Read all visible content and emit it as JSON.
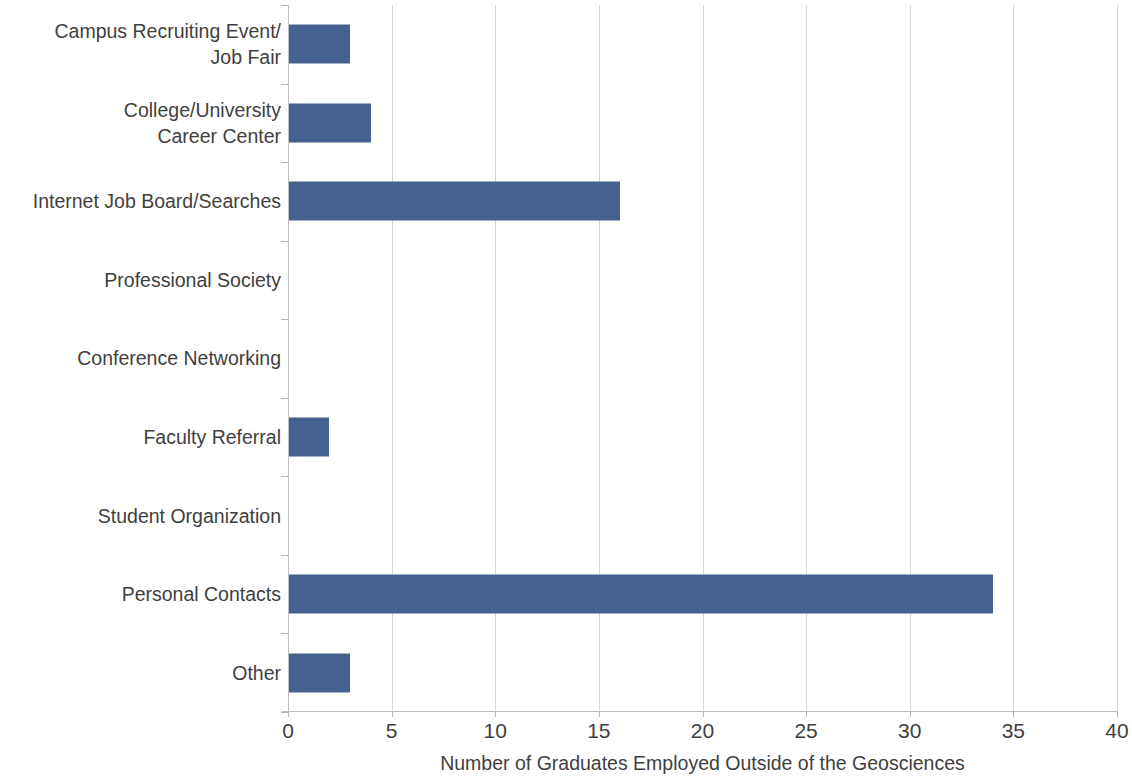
{
  "chart_data": {
    "type": "bar",
    "orientation": "horizontal",
    "title": "",
    "subtitle": "",
    "xlabel": "Number of Graduates Employed Outside of the Geosciences",
    "ylabel": "",
    "categories": [
      "Campus Recruiting Event/\nJob Fair",
      "College/University\nCareer Center",
      "Internet Job Board/Searches",
      "Professional Society",
      "Conference Networking",
      "Faculty Referral",
      "Student Organization",
      "Personal Contacts",
      "Other"
    ],
    "values": [
      3,
      4,
      16,
      0,
      0,
      2,
      0,
      34,
      3
    ],
    "xlim": [
      0,
      40
    ],
    "xticks": [
      0,
      5,
      10,
      15,
      20,
      25,
      30,
      35,
      40
    ],
    "xtick_labels": [
      "0",
      "5",
      "10",
      "15",
      "20",
      "25",
      "30",
      "35",
      "40"
    ],
    "grid": "vertical",
    "legend": "none",
    "bar_color": "#45618f",
    "gridline_color": "#d6d6d6",
    "axis_color": "#bfbfbf",
    "text_color": "#3f3f3f"
  }
}
